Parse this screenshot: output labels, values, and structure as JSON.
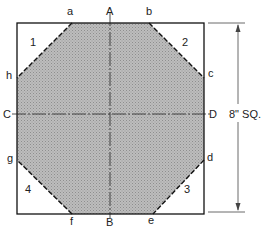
{
  "diagram": {
    "corner_labels": {
      "a": "a",
      "b": "b",
      "c": "c",
      "d": "d",
      "e": "e",
      "f": "f",
      "g": "g",
      "h": "h"
    },
    "axis_labels": {
      "A": "A",
      "B": "B",
      "C": "C",
      "D": "D"
    },
    "region_labels": [
      "1",
      "2",
      "3",
      "4"
    ],
    "dimension_label": "8\" SQ.",
    "colors": {
      "fill": "#b5b5b5",
      "line": "#111111"
    }
  }
}
